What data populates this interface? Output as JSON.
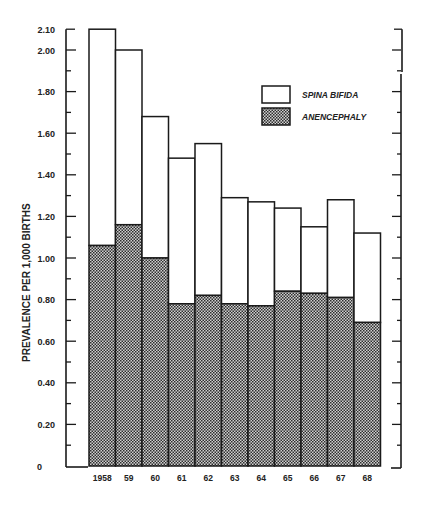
{
  "chart_data": {
    "type": "bar",
    "stacked": true,
    "title": "",
    "xlabel": "",
    "ylabel": "PREVALENCE PER 1,000 BIRTHS",
    "ylim": [
      0,
      2.1
    ],
    "categories": [
      "1958",
      "59",
      "60",
      "61",
      "62",
      "63",
      "64",
      "65",
      "66",
      "67",
      "68"
    ],
    "yticks": [
      "0",
      "0.20",
      "0.40",
      "0.60",
      "0.80",
      "1.00",
      "1.20",
      "1.40",
      "1.60",
      "1.80",
      "2.00",
      "2.10"
    ],
    "ytick_values": [
      0,
      0.2,
      0.4,
      0.6,
      0.8,
      1.0,
      1.2,
      1.4,
      1.6,
      1.8,
      2.0,
      2.1
    ],
    "series": [
      {
        "name": "ANENCEPHALY",
        "pattern": "crosshatch",
        "values": [
          1.06,
          1.16,
          1.0,
          0.78,
          0.82,
          0.78,
          0.77,
          0.84,
          0.83,
          0.81,
          0.69
        ]
      },
      {
        "name": "SPINA BIFIDA",
        "pattern": "white",
        "values": [
          1.04,
          0.84,
          0.68,
          0.7,
          0.73,
          0.51,
          0.5,
          0.4,
          0.32,
          0.47,
          0.43
        ]
      }
    ],
    "totals": [
      2.1,
      2.0,
      1.68,
      1.48,
      1.55,
      1.29,
      1.27,
      1.24,
      1.15,
      1.28,
      1.12
    ],
    "legend": {
      "position": "upper-right-inside",
      "entries": [
        "SPINA BIFIDA",
        "ANENCEPHALY"
      ]
    },
    "grid": false
  },
  "legend": {
    "spina_bifida": "SPINA BIFIDA",
    "anencephaly": "ANENCEPHALY"
  },
  "axes": {
    "ylabel": "PREVALENCE PER 1,000 BIRTHS"
  },
  "colors": {
    "ink": "#1a1a1a",
    "hatch_dark": "#333333",
    "hatch_light": "#d8d8d8",
    "background": "#ffffff"
  }
}
